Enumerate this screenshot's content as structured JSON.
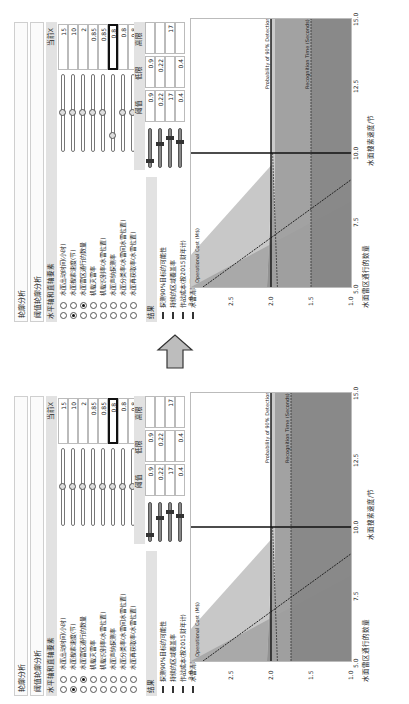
{
  "panels": [
    {
      "id": "before",
      "title": "轮廓分析",
      "subtitle": "阈值轮廓分析",
      "factors_header": "水平轴和直轴要素",
      "current_x_header": "当前X",
      "factors": [
        {
          "label": "水面出动时间(小时)",
          "value": "15",
          "radio1": false,
          "radio2": false,
          "knob_pct": 50
        },
        {
          "label": "水面搜索速度(节)",
          "value": "10",
          "radio1": true,
          "radio2": false,
          "knob_pct": 50
        },
        {
          "label": "水面雷区通行的数量",
          "value": "2",
          "radio1": false,
          "radio2": true,
          "knob_pct": 50
        },
        {
          "label": "机载灭雷率",
          "value": "0.85",
          "radio1": false,
          "radio2": false,
          "knob_pct": 50
        },
        {
          "label": "机载识别率(水雷位置)",
          "value": "0.85",
          "radio1": false,
          "radio2": false,
          "knob_pct": 50
        },
        {
          "label": "水面声纳探测率",
          "value": "0.8",
          "radio1": false,
          "radio2": false,
          "knob_pct": 50,
          "highlight": true
        },
        {
          "label": "水面分类率(水雷间水雷位置)",
          "value": "0.8",
          "radio1": false,
          "radio2": false,
          "knob_pct": 50
        },
        {
          "label": "水面再获取率(水雷位置)",
          "value": "0.8",
          "radio1": false,
          "radio2": false,
          "knob_pct": 50
        }
      ],
      "results_header": "结果",
      "threshold_headers": {
        "threshold": "阈值",
        "low": "低限",
        "high": "高限"
      },
      "results": [
        {
          "label": "探测90%目标的可能性",
          "threshold": "0.9",
          "low": "0.9",
          "high": ""
        },
        {
          "label": "持续的区域覆盖率",
          "threshold": "0.22",
          "low": "0.22",
          "high": ""
        },
        {
          "label": "作战成本(按2015财年计)",
          "threshold": "17",
          "low": "",
          "high": "17"
        },
        {
          "label": "水雷清除百分比",
          "threshold": "0.4",
          "low": "0.4",
          "high": ""
        }
      ]
    },
    {
      "id": "after",
      "title": "轮廓分析",
      "subtitle": "阈值轮廓分析",
      "factors_header": "水平轴和直轴要素",
      "current_x_header": "当前X",
      "factors": [
        {
          "label": "水面出动时间(小时)",
          "value": "15",
          "radio1": false,
          "radio2": false,
          "knob_pct": 50
        },
        {
          "label": "水面搜索速度(节)",
          "value": "10",
          "radio1": true,
          "radio2": false,
          "knob_pct": 50
        },
        {
          "label": "水面雷区通行的数量",
          "value": "2",
          "radio1": false,
          "radio2": true,
          "knob_pct": 50
        },
        {
          "label": "机载灭雷率",
          "value": "0.85",
          "radio1": false,
          "radio2": false,
          "knob_pct": 50
        },
        {
          "label": "机载识别率(水雷位置)",
          "value": "0.85",
          "radio1": false,
          "radio2": false,
          "knob_pct": 50
        },
        {
          "label": "水面声纳探测率",
          "value": "0.8",
          "radio1": false,
          "radio2": false,
          "knob_pct": 20,
          "highlight": true
        },
        {
          "label": "水面分类率(水雷间水雷位置)",
          "value": "0.8",
          "radio1": false,
          "radio2": false,
          "knob_pct": 50
        },
        {
          "label": "水面再获取率(水雷位置)",
          "value": "0.8",
          "radio1": false,
          "radio2": false,
          "knob_pct": 50
        }
      ],
      "results_header": "结果",
      "threshold_headers": {
        "threshold": "阈值",
        "low": "低限",
        "high": "高限"
      },
      "results": [
        {
          "label": "探测90%目标的可能性",
          "threshold": "0.9",
          "low": "0.9",
          "high": ""
        },
        {
          "label": "持续的区域覆盖率",
          "threshold": "0.22",
          "low": "0.22",
          "high": ""
        },
        {
          "label": "作战成本(按2015财年计)",
          "threshold": "17",
          "low": "",
          "high": "17"
        },
        {
          "label": "水雷清除百分比",
          "threshold": "0.4",
          "low": "0.4",
          "high": ""
        }
      ]
    }
  ],
  "chart": {
    "ylabel": "水面雷区通行的数量",
    "xlabel": "水面搜索速度/节",
    "yticks": [
      "3.0",
      "2.5",
      "2.0",
      "1.5",
      "1.0"
    ],
    "xticks": [
      "5.0",
      "7.5",
      "10.0",
      "12.5",
      "15.0"
    ],
    "annotations": [
      "Operational Cost (M$)",
      "Probability of 90% Detection",
      "Recognition Time (Seconds)"
    ]
  },
  "arrow": {
    "direction": "up",
    "color": "#bdbdbd"
  }
}
